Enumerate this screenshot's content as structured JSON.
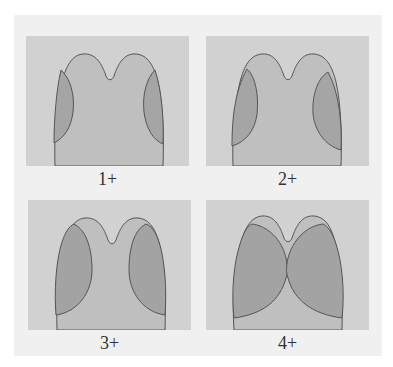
{
  "figure": {
    "colors": {
      "background": "#ffffff",
      "frame": "#f0f0f0",
      "panel_bg": "#d1d1d1",
      "head_fill": "#bfbfbf",
      "oval_fill": "#a3a3a3",
      "outline": "#555555"
    },
    "panels": [
      {
        "label": "1+",
        "grade": 1
      },
      {
        "label": "2+",
        "grade": 2
      },
      {
        "label": "3+",
        "grade": 3
      },
      {
        "label": "4+",
        "grade": 4
      }
    ]
  }
}
